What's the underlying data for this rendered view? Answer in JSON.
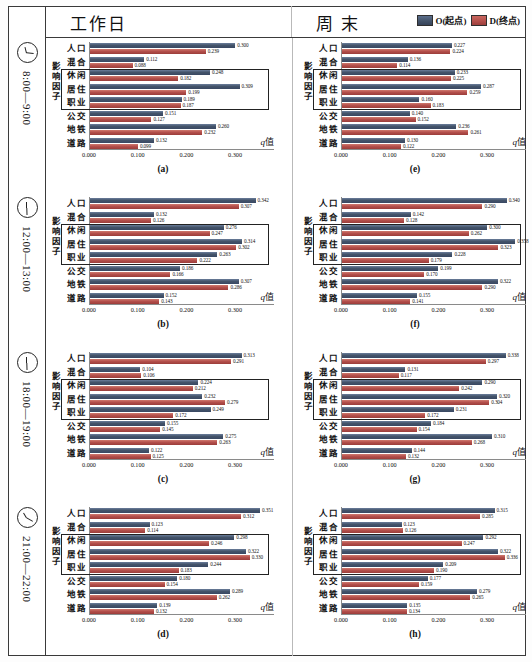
{
  "header": {
    "left_title": "工作日",
    "right_title": "周  末",
    "legend": [
      {
        "key": "O",
        "label": "O(起点)",
        "color": "#44546A"
      },
      {
        "key": "D",
        "label": "D(终点)",
        "color": "#B5504C"
      }
    ]
  },
  "axis": {
    "y_label": "影响因子",
    "x_label_italic": "q",
    "x_label_rest": "值",
    "ticks": [
      "0.000",
      "0.100",
      "0.200",
      "0.300"
    ],
    "tick_values": [
      0.0,
      0.1,
      0.2,
      0.3
    ],
    "xmin": 0.0,
    "xmax": 0.38
  },
  "categories": [
    "人口",
    "混合",
    "休闲",
    "居住",
    "职业",
    "公交",
    "地铁",
    "道路"
  ],
  "highlight_rows": [
    2,
    3,
    4
  ],
  "time_rows": [
    {
      "icon": "clock-icon",
      "label": "8:00—9:00"
    },
    {
      "icon": "clock-icon",
      "label": "12:00—13:00"
    },
    {
      "icon": "clock-icon",
      "label": "18:00—19:00"
    },
    {
      "icon": "clock-icon",
      "label": "21:00—22:00"
    }
  ],
  "chart_data": [
    {
      "id": "a",
      "type": "bar",
      "title": "(a)",
      "column": "工作日",
      "time": "8:00—9:00",
      "categories": [
        "人口",
        "混合",
        "休闲",
        "居住",
        "职业",
        "公交",
        "地铁",
        "道路"
      ],
      "series": [
        {
          "name": "O(起点)",
          "values": [
            0.3,
            0.112,
            0.248,
            0.309,
            0.189,
            0.151,
            0.26,
            0.132
          ]
        },
        {
          "name": "D(终点)",
          "values": [
            0.239,
            0.088,
            0.182,
            0.199,
            0.187,
            0.127,
            0.232,
            0.099
          ]
        }
      ],
      "xlabel": "q值",
      "ylabel": "影响因子",
      "xlim": [
        0.0,
        0.38
      ],
      "grid": false,
      "legend_position": "top-right"
    },
    {
      "id": "b",
      "type": "bar",
      "title": "(b)",
      "column": "工作日",
      "time": "12:00—13:00",
      "categories": [
        "人口",
        "混合",
        "休闲",
        "居住",
        "职业",
        "公交",
        "地铁",
        "道路"
      ],
      "series": [
        {
          "name": "O(起点)",
          "values": [
            0.342,
            0.132,
            0.276,
            0.314,
            0.263,
            0.186,
            0.307,
            0.152
          ]
        },
        {
          "name": "D(终点)",
          "values": [
            0.307,
            0.126,
            0.247,
            0.302,
            0.222,
            0.166,
            0.286,
            0.143
          ]
        }
      ],
      "xlabel": "q值",
      "ylabel": "影响因子",
      "xlim": [
        0.0,
        0.38
      ],
      "grid": false,
      "legend_position": "top-right"
    },
    {
      "id": "c",
      "type": "bar",
      "title": "(c)",
      "column": "工作日",
      "time": "18:00—19:00",
      "categories": [
        "人口",
        "混合",
        "休闲",
        "居住",
        "职业",
        "公交",
        "地铁",
        "道路"
      ],
      "series": [
        {
          "name": "O(起点)",
          "values": [
            0.313,
            0.104,
            0.224,
            0.232,
            0.249,
            0.155,
            0.275,
            0.122
          ]
        },
        {
          "name": "D(终点)",
          "values": [
            0.291,
            0.106,
            0.212,
            0.279,
            0.172,
            0.145,
            0.263,
            0.125
          ]
        }
      ],
      "xlabel": "q值",
      "ylabel": "影响因子",
      "xlim": [
        0.0,
        0.38
      ],
      "grid": false,
      "legend_position": "top-right"
    },
    {
      "id": "d",
      "type": "bar",
      "title": "(d)",
      "column": "工作日",
      "time": "21:00—22:00",
      "categories": [
        "人口",
        "混合",
        "休闲",
        "居住",
        "职业",
        "公交",
        "地铁",
        "道路"
      ],
      "series": [
        {
          "name": "O(起点)",
          "values": [
            0.351,
            0.123,
            0.298,
            0.322,
            0.244,
            0.18,
            0.289,
            0.139
          ]
        },
        {
          "name": "D(终点)",
          "values": [
            0.312,
            0.114,
            0.246,
            0.33,
            0.183,
            0.154,
            0.262,
            0.132
          ]
        }
      ],
      "xlabel": "q值",
      "ylabel": "影响因子",
      "xlim": [
        0.0,
        0.38
      ],
      "grid": false,
      "legend_position": "top-right"
    },
    {
      "id": "e",
      "type": "bar",
      "title": "(e)",
      "column": "周  末",
      "time": "8:00—9:00",
      "categories": [
        "人口",
        "混合",
        "休闲",
        "居住",
        "职业",
        "公交",
        "地铁",
        "道路"
      ],
      "series": [
        {
          "name": "O(起点)",
          "values": [
            0.227,
            0.136,
            0.233,
            0.287,
            0.16,
            0.14,
            0.236,
            0.13
          ]
        },
        {
          "name": "D(终点)",
          "values": [
            0.224,
            0.114,
            0.225,
            0.259,
            0.183,
            0.152,
            0.261,
            0.122
          ]
        }
      ],
      "xlabel": "q值",
      "ylabel": "影响因子",
      "xlim": [
        0.0,
        0.38
      ],
      "grid": false,
      "legend_position": "top-right"
    },
    {
      "id": "f",
      "type": "bar",
      "title": "(f)",
      "column": "周  末",
      "time": "12:00—13:00",
      "categories": [
        "人口",
        "混合",
        "休闲",
        "居住",
        "职业",
        "公交",
        "地铁",
        "道路"
      ],
      "series": [
        {
          "name": "O(起点)",
          "values": [
            0.34,
            0.142,
            0.3,
            0.358,
            0.228,
            0.199,
            0.322,
            0.155
          ]
        },
        {
          "name": "D(终点)",
          "values": [
            0.29,
            0.128,
            0.262,
            0.323,
            0.179,
            0.17,
            0.29,
            0.141
          ]
        }
      ],
      "xlabel": "q值",
      "ylabel": "影响因子",
      "xlim": [
        0.0,
        0.38
      ],
      "grid": false,
      "legend_position": "top-right"
    },
    {
      "id": "g",
      "type": "bar",
      "title": "(g)",
      "column": "周  末",
      "time": "18:00—19:00",
      "categories": [
        "人口",
        "混合",
        "休闲",
        "居住",
        "职业",
        "公交",
        "地铁",
        "道路"
      ],
      "series": [
        {
          "name": "O(起点)",
          "values": [
            0.338,
            0.131,
            0.29,
            0.32,
            0.231,
            0.184,
            0.31,
            0.144
          ]
        },
        {
          "name": "D(终点)",
          "values": [
            0.297,
            0.117,
            0.242,
            0.304,
            0.172,
            0.154,
            0.268,
            0.132
          ]
        }
      ],
      "xlabel": "q值",
      "ylabel": "影响因子",
      "xlim": [
        0.0,
        0.38
      ],
      "grid": false,
      "legend_position": "top-right"
    },
    {
      "id": "h",
      "type": "bar",
      "title": "(h)",
      "column": "周  末",
      "time": "21:00—22:00",
      "categories": [
        "人口",
        "混合",
        "休闲",
        "居住",
        "职业",
        "公交",
        "地铁",
        "道路"
      ],
      "series": [
        {
          "name": "O(起点)",
          "values": [
            0.315,
            0.123,
            0.292,
            0.322,
            0.209,
            0.177,
            0.279,
            0.135
          ]
        },
        {
          "name": "D(终点)",
          "values": [
            0.285,
            0.126,
            0.247,
            0.336,
            0.19,
            0.159,
            0.265,
            0.134
          ]
        }
      ],
      "xlabel": "q值",
      "ylabel": "影响因子",
      "xlim": [
        0.0,
        0.38
      ],
      "grid": false,
      "legend_position": "top-right"
    }
  ]
}
